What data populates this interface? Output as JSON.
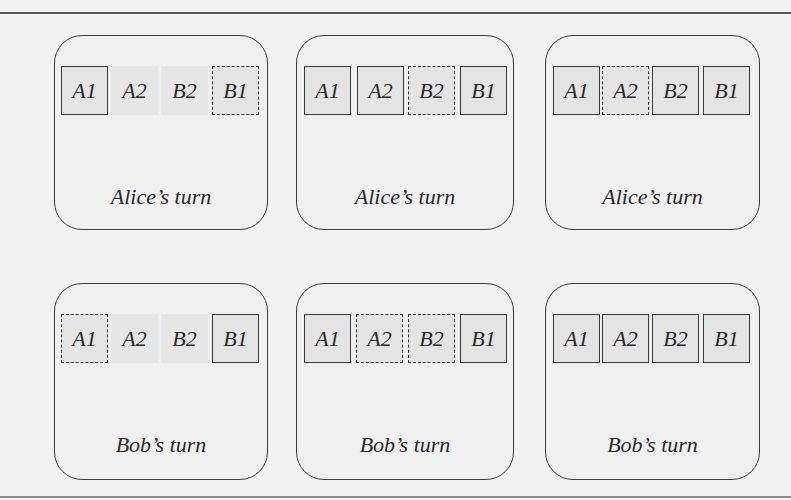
{
  "diagram": {
    "colors": {
      "background": "#f2f2f2",
      "panel_border": "#3c3c3c",
      "cell_fill": "#e4e4e4",
      "text": "#2a2a2a"
    },
    "rows": [
      {
        "panels": [
          {
            "label": "Alice’s turn",
            "cells": [
              {
                "text": "A1",
                "style": "solid"
              },
              {
                "text": "A2",
                "style": "none"
              },
              {
                "text": "B2",
                "style": "none"
              },
              {
                "text": "B1",
                "style": "dashed"
              }
            ]
          },
          {
            "label": "Alice’s turn",
            "cells": [
              {
                "text": "A1",
                "style": "solid"
              },
              {
                "text": "A2",
                "style": "solid"
              },
              {
                "text": "B2",
                "style": "dashed"
              },
              {
                "text": "B1",
                "style": "solid"
              }
            ]
          },
          {
            "label": "Alice’s turn",
            "cells": [
              {
                "text": "A1",
                "style": "solid"
              },
              {
                "text": "A2",
                "style": "dashed"
              },
              {
                "text": "B2",
                "style": "solid"
              },
              {
                "text": "B1",
                "style": "solid"
              }
            ]
          }
        ]
      },
      {
        "panels": [
          {
            "label": "Bob’s turn",
            "cells": [
              {
                "text": "A1",
                "style": "dashed"
              },
              {
                "text": "A2",
                "style": "none"
              },
              {
                "text": "B2",
                "style": "none"
              },
              {
                "text": "B1",
                "style": "solid"
              }
            ]
          },
          {
            "label": "Bob’s turn",
            "cells": [
              {
                "text": "A1",
                "style": "solid"
              },
              {
                "text": "A2",
                "style": "dashed"
              },
              {
                "text": "B2",
                "style": "dashed"
              },
              {
                "text": "B1",
                "style": "solid"
              }
            ]
          },
          {
            "label": "Bob’s turn",
            "cells": [
              {
                "text": "A1",
                "style": "solid"
              },
              {
                "text": "A2",
                "style": "solid"
              },
              {
                "text": "B2",
                "style": "solid"
              },
              {
                "text": "B1",
                "style": "solid"
              }
            ]
          }
        ]
      }
    ]
  }
}
